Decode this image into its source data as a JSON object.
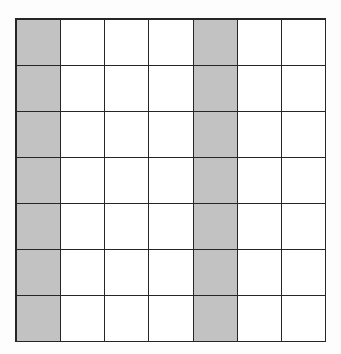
{
  "figure": {
    "name": "shaded-column-grid",
    "rows": 7,
    "columns": 7,
    "shaded_columns": [
      1,
      5
    ],
    "shaded_count": 14,
    "unshaded_count": 35,
    "total_cells": 49
  },
  "colors": {
    "shaded_fill": "#c2c2c2",
    "unshaded_fill": "#ffffff",
    "grid_line": "#262626",
    "background": "#fdfdfd"
  },
  "chart_data": {
    "type": "heatmap",
    "title": "",
    "subtitle": "",
    "xlabel": "",
    "ylabel": "",
    "legend": [],
    "annotations": [],
    "grid": true,
    "x": [
      1,
      2,
      3,
      4,
      5,
      6,
      7
    ],
    "y": [
      1,
      2,
      3,
      4,
      5,
      6,
      7
    ],
    "xticklabels": [
      "",
      "",
      "",
      "",
      "",
      "",
      ""
    ],
    "yticklabels": [
      "",
      "",
      "",
      "",
      "",
      "",
      ""
    ],
    "values": [
      [
        1,
        0,
        0,
        0,
        1,
        0,
        0
      ],
      [
        1,
        0,
        0,
        0,
        1,
        0,
        0
      ],
      [
        1,
        0,
        0,
        0,
        1,
        0,
        0
      ],
      [
        1,
        0,
        0,
        0,
        1,
        0,
        0
      ],
      [
        1,
        0,
        0,
        0,
        1,
        0,
        0
      ],
      [
        1,
        0,
        0,
        0,
        1,
        0,
        0
      ],
      [
        1,
        0,
        0,
        0,
        1,
        0,
        0
      ]
    ]
  }
}
